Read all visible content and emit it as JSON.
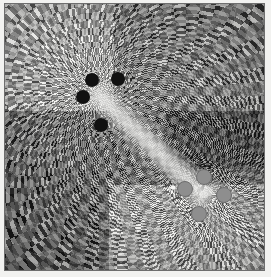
{
  "figure": {
    "title": "Conformal grid plot of a complex rational function",
    "background_color": "#f2f2f0",
    "frame_color": "#6e6e6e",
    "grid_light_color": "#f4f4f2",
    "grid_dark_color": "#141414",
    "mid_gray_color": "#9a9a9a",
    "zero_marker_color": "#111111",
    "pole_marker_color": "#8e8e8e"
  },
  "chart_data": {
    "type": "heatmap",
    "title": "Conformal grid plot of a complex rational function",
    "subtitle": "",
    "xlabel": "",
    "ylabel": "",
    "xlim": [
      -1,
      1
    ],
    "ylim": [
      -1,
      1
    ],
    "grid": true,
    "legend": "none",
    "colormap": "grayscale-checkerboard",
    "render_style": "checkerboard conformal grid",
    "annotations": [
      "radial fan of arcs emanating from each singular point",
      "bright diagonal band bridging the zero cluster to the pole cluster",
      "high-contrast black and white checkerboard in the lower-left quadrant",
      "fine light-gray concentric arcs across the lower-center region"
    ],
    "tone_regions": [
      {
        "name": "upper-left",
        "tone": "light checkerboard",
        "value": 0.78
      },
      {
        "name": "upper-right",
        "tone": "medium checkerboard",
        "value": 0.55
      },
      {
        "name": "mid-right",
        "tone": "dark fine stripes",
        "value": 0.34
      },
      {
        "name": "lower-left",
        "tone": "high-contrast checkerboard",
        "value": 0.5
      },
      {
        "name": "lower-center",
        "tone": "light fine arcs",
        "value": 0.8
      },
      {
        "name": "center-band",
        "tone": "bright bridge",
        "value": 0.92
      }
    ],
    "markers": {
      "zeros": {
        "label": "zeros",
        "count": 4,
        "marker": "filled circle",
        "color": "#111111",
        "radius_px": 7,
        "points": [
          {
            "x": 0.336,
            "y": 0.287
          },
          {
            "x": 0.436,
            "y": 0.283
          },
          {
            "x": 0.3,
            "y": 0.348
          },
          {
            "x": 0.37,
            "y": 0.455
          }
        ]
      },
      "poles": {
        "label": "poles",
        "count": 4,
        "marker": "filled circle",
        "color": "#8e8e8e",
        "radius_px": 7,
        "points": [
          {
            "x": 0.768,
            "y": 0.65
          },
          {
            "x": 0.695,
            "y": 0.694
          },
          {
            "x": 0.845,
            "y": 0.718
          },
          {
            "x": 0.748,
            "y": 0.79
          }
        ]
      }
    },
    "grid_families": [
      {
        "name": "radial-rays",
        "count": 72,
        "origin": "zero-cluster"
      },
      {
        "name": "concentric-arcs",
        "count": 48,
        "origin": "zero-cluster"
      },
      {
        "name": "radial-rays",
        "count": 72,
        "origin": "pole-cluster"
      },
      {
        "name": "concentric-arcs",
        "count": 48,
        "origin": "pole-cluster"
      }
    ]
  }
}
